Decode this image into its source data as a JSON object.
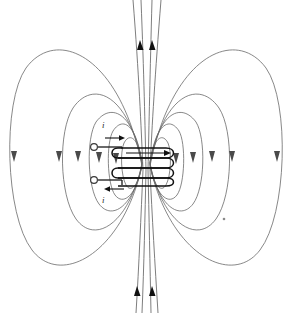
{
  "figure": {
    "background_color": "#ffffff",
    "width": 292,
    "height": 313,
    "fieldline_color": "#6a6a6a",
    "wire_color": "#111111",
    "arrow_color": "#4a4a4a"
  },
  "labels": {
    "current_top": "i",
    "current_bottom": "i"
  },
  "coil": {
    "turns": 4,
    "center_x": 146,
    "center_y": 163,
    "turn_width": 60,
    "turn_height": 11,
    "turn_spacing": 11
  },
  "leads": {
    "top_terminal_x": 94,
    "top_terminal_y": 147,
    "bottom_terminal_x": 94,
    "bottom_terminal_y": 180,
    "top_current_direction": "right",
    "bottom_current_direction": "left"
  },
  "field_lines": {
    "outer_loop_count": 2,
    "inner_loop_count": 4,
    "axis_line_count": 4,
    "arrow_direction_sides": "down",
    "arrow_direction_axis": "up"
  },
  "marks": {
    "stray_dot_x": 224,
    "stray_dot_y": 219
  }
}
